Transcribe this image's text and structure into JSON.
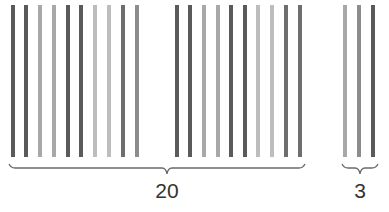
{
  "colors": {
    "dark": "#5a5a5a",
    "medium_dark": "#6e6e6e",
    "medium": "#8c8c8c",
    "light": "#a8a8a8",
    "lighter": "#bdbdbd",
    "brace": "#6a6a6a",
    "text": "#333333"
  },
  "bars": [
    {
      "x": 11,
      "shade": "dark"
    },
    {
      "x": 24,
      "shade": "dark"
    },
    {
      "x": 38,
      "shade": "light"
    },
    {
      "x": 52,
      "shade": "light"
    },
    {
      "x": 66,
      "shade": "dark"
    },
    {
      "x": 79,
      "shade": "dark"
    },
    {
      "x": 93,
      "shade": "lighter"
    },
    {
      "x": 107,
      "shade": "lighter"
    },
    {
      "x": 121,
      "shade": "medium_dark"
    },
    {
      "x": 135,
      "shade": "medium"
    },
    {
      "x": 175,
      "shade": "dark"
    },
    {
      "x": 188,
      "shade": "dark"
    },
    {
      "x": 202,
      "shade": "light"
    },
    {
      "x": 216,
      "shade": "light"
    },
    {
      "x": 229,
      "shade": "dark"
    },
    {
      "x": 243,
      "shade": "dark"
    },
    {
      "x": 256,
      "shade": "lighter"
    },
    {
      "x": 270,
      "shade": "lighter"
    },
    {
      "x": 284,
      "shade": "medium_dark"
    },
    {
      "x": 298,
      "shade": "medium_dark"
    },
    {
      "x": 343,
      "shade": "light"
    },
    {
      "x": 357,
      "shade": "medium"
    },
    {
      "x": 371,
      "shade": "dark"
    }
  ],
  "groups": [
    {
      "label": "20",
      "count": 20,
      "brace_x1": 9,
      "brace_x2": 305,
      "label_x": 167
    },
    {
      "label": "3",
      "count": 3,
      "brace_x1": 342,
      "brace_x2": 378,
      "label_x": 360
    }
  ]
}
